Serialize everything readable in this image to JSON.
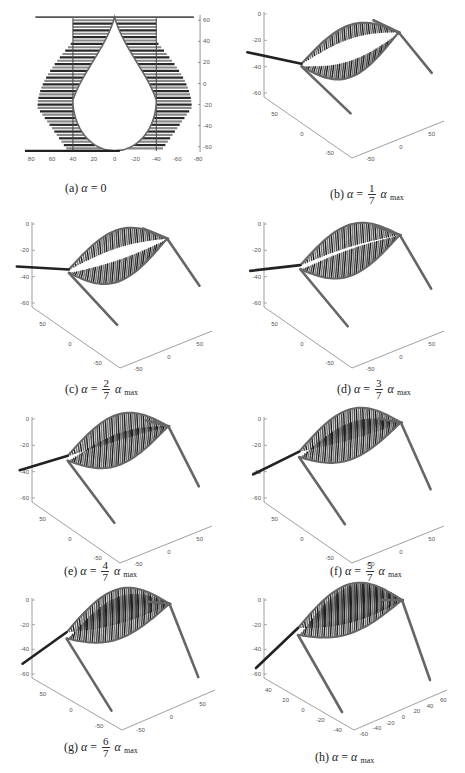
{
  "figure": {
    "panels": [
      {
        "id": "a",
        "label": "(a)",
        "caption_prefix": "(a)",
        "symbol": "α",
        "eq": "=",
        "value": "0",
        "frac": null,
        "sub": ""
      },
      {
        "id": "b",
        "label": "(b)",
        "caption_prefix": "(b)",
        "symbol": "α",
        "eq": "=",
        "frac": {
          "num": "1",
          "den": "7"
        },
        "alpha": "α",
        "sub": "max"
      },
      {
        "id": "c",
        "label": "(c)",
        "caption_prefix": "(c)",
        "symbol": "α",
        "eq": "=",
        "frac": {
          "num": "2",
          "den": "7"
        },
        "alpha": "α",
        "sub": "max"
      },
      {
        "id": "d",
        "label": "(d)",
        "caption_prefix": "(d)",
        "symbol": "α",
        "eq": "=",
        "frac": {
          "num": "3",
          "den": "7"
        },
        "alpha": "α",
        "sub": "max"
      },
      {
        "id": "e",
        "label": "(e)",
        "caption_prefix": "(e)",
        "symbol": "α",
        "eq": "=",
        "frac": {
          "num": "4",
          "den": "7"
        },
        "alpha": "α",
        "sub": "max"
      },
      {
        "id": "f",
        "label": "(f)",
        "caption_prefix": "(f)",
        "symbol": "α",
        "eq": "=",
        "frac": {
          "num": "5",
          "den": "7"
        },
        "alpha": "α",
        "sub": "max"
      },
      {
        "id": "g",
        "label": "(g)",
        "caption_prefix": "(g)",
        "symbol": "α",
        "eq": "=",
        "frac": {
          "num": "6",
          "den": "7"
        },
        "alpha": "α",
        "sub": "max"
      },
      {
        "id": "h",
        "label": "(h)",
        "caption_prefix": "(h)",
        "symbol": "α",
        "eq": "=",
        "value": "α",
        "frac": null,
        "sub": "max"
      }
    ]
  },
  "chart_data": [
    {
      "type": "line",
      "panel": "(a)",
      "title": "(a) α = 0",
      "description": "2D top view: teardrop-shaped opening with horizontal bar elements on both sides, straight edges at top",
      "x_ticks": [
        80,
        60,
        40,
        20,
        0,
        -20,
        -40,
        -60,
        -80
      ],
      "y_ticks": [
        60,
        40,
        20,
        0,
        -20,
        -40,
        -60
      ],
      "xlim": [
        85,
        -80
      ],
      "ylim": [
        -65,
        65
      ],
      "colors": {
        "bars": "#2a2a2a",
        "bars_alt": "#888888",
        "edge": "#666666"
      }
    },
    {
      "type": "line",
      "panel": "(b)",
      "title": "(b) α = 1/7 α max",
      "projection": "3d",
      "z_ticks": [
        0,
        -20,
        -40,
        -60
      ],
      "y_ticks": [
        50,
        0,
        -50
      ],
      "x_ticks": [
        -50,
        0,
        50
      ]
    },
    {
      "type": "line",
      "panel": "(c)",
      "title": "(c) α = 2/7 α max",
      "projection": "3d",
      "z_ticks": [
        0,
        -20,
        -40,
        -60
      ],
      "y_ticks": [
        50,
        0,
        -50
      ],
      "x_ticks": [
        -50,
        0,
        50
      ]
    },
    {
      "type": "line",
      "panel": "(d)",
      "title": "(d) α = 3/7 α max",
      "projection": "3d",
      "z_ticks": [
        0,
        -20,
        -40,
        -60
      ],
      "y_ticks": [
        50,
        0,
        -50
      ],
      "x_ticks": [
        -50,
        0,
        50
      ]
    },
    {
      "type": "line",
      "panel": "(e)",
      "title": "(e) α = 4/7 α max",
      "projection": "3d",
      "z_ticks": [
        0,
        -20,
        -40,
        -60
      ],
      "y_ticks": [
        50,
        0,
        -50
      ],
      "x_ticks": [
        -50,
        0,
        50
      ]
    },
    {
      "type": "line",
      "panel": "(f)",
      "title": "(f) α = 5/7 α max",
      "projection": "3d",
      "z_ticks": [
        0,
        -20,
        -40,
        -60
      ],
      "y_ticks": [
        50,
        0,
        -50
      ],
      "x_ticks": [
        -50,
        0,
        50
      ]
    },
    {
      "type": "line",
      "panel": "(g)",
      "title": "(g) α = 6/7 α max",
      "projection": "3d",
      "z_ticks": [
        0,
        -20,
        -40,
        -60
      ],
      "y_ticks": [
        50,
        0,
        -50
      ],
      "x_ticks": [
        -50,
        0,
        50
      ]
    },
    {
      "type": "line",
      "panel": "(h)",
      "title": "(h) α = α max",
      "projection": "3d",
      "z_ticks": [
        0,
        -20,
        -40,
        -60
      ],
      "y_ticks": [
        40,
        20,
        0,
        -20,
        -40
      ],
      "x_ticks": [
        -60,
        -40,
        -20,
        0,
        20,
        40,
        60
      ]
    }
  ]
}
